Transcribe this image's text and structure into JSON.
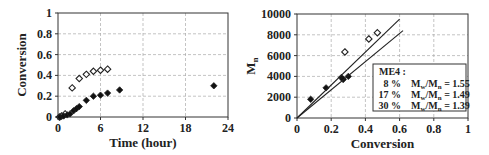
{
  "chart_data": [
    {
      "type": "scatter",
      "title": "",
      "xlabel": "Time (hour)",
      "ylabel": "Conversion",
      "xlim": [
        0,
        24
      ],
      "ylim": [
        0,
        1
      ],
      "xticks": [
        "0",
        "6",
        "12",
        "18",
        "24"
      ],
      "yticks": [
        "0",
        "0.2",
        "0.4",
        "0.6",
        "0.8",
        "1"
      ],
      "grid": true,
      "series": [
        {
          "name": "open diamonds",
          "marker": "open-diamond",
          "points": [
            [
              0.2,
              0.0
            ],
            [
              0.5,
              0.01
            ],
            [
              1.0,
              0.03
            ],
            [
              2.0,
              0.28
            ],
            [
              3.0,
              0.37
            ],
            [
              4.0,
              0.41
            ],
            [
              5.0,
              0.44
            ],
            [
              6.0,
              0.45
            ],
            [
              7.0,
              0.46
            ]
          ]
        },
        {
          "name": "filled diamonds",
          "marker": "filled-diamond",
          "points": [
            [
              0.3,
              0.0
            ],
            [
              0.8,
              0.01
            ],
            [
              1.3,
              0.02
            ],
            [
              1.7,
              0.03
            ],
            [
              2.2,
              0.06
            ],
            [
              2.6,
              0.08
            ],
            [
              3.0,
              0.1
            ],
            [
              4.0,
              0.16
            ],
            [
              5.0,
              0.2
            ],
            [
              6.0,
              0.21
            ],
            [
              7.0,
              0.23
            ],
            [
              8.7,
              0.26
            ],
            [
              22.0,
              0.3
            ]
          ]
        }
      ]
    },
    {
      "type": "scatter",
      "title": "",
      "xlabel": "Conversion",
      "ylabel": "Mn",
      "xlim": [
        0,
        1
      ],
      "ylim": [
        0,
        10000
      ],
      "xticks": [
        "0",
        "0.2",
        "0.4",
        "0.6",
        "0.8",
        "1"
      ],
      "yticks": [
        "0",
        "2000",
        "4000",
        "6000",
        "8000",
        "10000"
      ],
      "grid": true,
      "series": [
        {
          "name": "open diamonds",
          "marker": "open-diamond",
          "points": [
            [
              0.28,
              6350
            ],
            [
              0.42,
              7600
            ],
            [
              0.47,
              8200
            ]
          ]
        },
        {
          "name": "filled diamonds",
          "marker": "filled-diamond",
          "points": [
            [
              0.08,
              1800
            ],
            [
              0.17,
              2900
            ],
            [
              0.26,
              3900
            ],
            [
              0.27,
              3700
            ],
            [
              0.3,
              4000
            ]
          ]
        },
        {
          "name": "line upper",
          "marker": "line",
          "points": [
            [
              0,
              0
            ],
            [
              0.6,
              9500
            ]
          ]
        },
        {
          "name": "line lower",
          "marker": "line",
          "points": [
            [
              0,
              0
            ],
            [
              0.62,
              8400
            ]
          ]
        }
      ],
      "legend": {
        "title": "ME4 :",
        "rows": [
          {
            "pct": "8 %",
            "ratio_label": "Mw/Mn",
            "ratio_value": "= 1.55"
          },
          {
            "pct": "17 %",
            "ratio_label": "Mw/Mn",
            "ratio_value": "= 1.49"
          },
          {
            "pct": "30 %",
            "ratio_label": "Mw/Mn",
            "ratio_value": "= 1.39"
          }
        ],
        "position": "lower right"
      }
    }
  ]
}
